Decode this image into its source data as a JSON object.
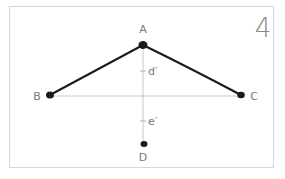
{
  "figure": {
    "panel_number": "4",
    "points": {
      "A": {
        "label": "A",
        "x": 143,
        "y": 45,
        "label_x": 143,
        "label_y": 33
      },
      "B": {
        "label": "B",
        "x": 50,
        "y": 95,
        "label_x": 37,
        "label_y": 100
      },
      "C": {
        "label": "C",
        "x": 241,
        "y": 95,
        "label_x": 254,
        "label_y": 100
      },
      "D": {
        "label": "D",
        "x": 144,
        "y": 144,
        "label_x": 143,
        "label_y": 161
      }
    },
    "markers": {
      "d_prime": {
        "label": "d′",
        "tick_y": 71,
        "label_x": 150,
        "label_y": 75
      },
      "e_prime": {
        "label": "e′",
        "tick_y": 121,
        "label_x": 150,
        "label_y": 125
      }
    },
    "colors": {
      "stroke": "#1a1a1a",
      "guide": "#c8c8c8",
      "label": "#7a7a7a",
      "frame": "#d6d6d6"
    }
  }
}
